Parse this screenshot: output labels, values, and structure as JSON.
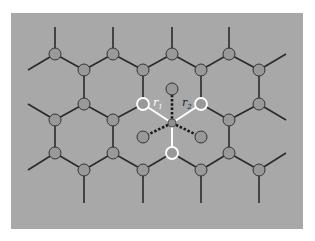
{
  "figure": {
    "background_color": "#ffffff",
    "panel_color": "#a8a8a8",
    "bond_color": "#2a2a2a",
    "node_fill": "#999999",
    "node_stroke": "#333333",
    "highlight_color": "#ffffff",
    "labels": {
      "r1": "r",
      "r1_sub": "1",
      "r2": "r",
      "r2_sub": "2"
    }
  },
  "lattice": {
    "nodes": [
      {
        "x": 55,
        "y": 54
      },
      {
        "x": 113,
        "y": 54
      },
      {
        "x": 172,
        "y": 54
      },
      {
        "x": 229,
        "y": 54
      },
      {
        "x": 84,
        "y": 70
      },
      {
        "x": 143,
        "y": 70
      },
      {
        "x": 201,
        "y": 70
      },
      {
        "x": 259,
        "y": 70
      },
      {
        "x": 84,
        "y": 104
      },
      {
        "x": 143,
        "y": 104,
        "hl": true
      },
      {
        "x": 201,
        "y": 104,
        "hl": true
      },
      {
        "x": 259,
        "y": 104
      },
      {
        "x": 55,
        "y": 120
      },
      {
        "x": 113,
        "y": 120
      },
      {
        "x": 229,
        "y": 120
      },
      {
        "x": 55,
        "y": 153
      },
      {
        "x": 113,
        "y": 153
      },
      {
        "x": 172,
        "y": 153,
        "hl": true
      },
      {
        "x": 229,
        "y": 153
      },
      {
        "x": 84,
        "y": 170
      },
      {
        "x": 143,
        "y": 170
      },
      {
        "x": 201,
        "y": 170
      },
      {
        "x": 259,
        "y": 170
      }
    ],
    "center": {
      "x": 172,
      "y": 123
    },
    "adsorbates": [
      {
        "x": 172,
        "y": 89
      },
      {
        "x": 143,
        "y": 137
      },
      {
        "x": 201,
        "y": 137
      }
    ]
  }
}
